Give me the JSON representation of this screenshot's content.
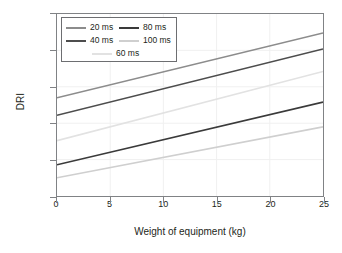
{
  "chart_data": {
    "type": "line",
    "title": "",
    "xlabel": "Weight of equipment (kg)",
    "ylabel": "DRI",
    "xlim": [
      0,
      25
    ],
    "ylim": [
      5,
      30
    ],
    "xticks": [
      0,
      5,
      10,
      15,
      20,
      25
    ],
    "yticks": [
      5,
      10,
      15,
      20,
      25,
      30
    ],
    "grid": true,
    "legend_position": "top-left",
    "x": [
      0,
      25
    ],
    "series": [
      {
        "name": "20 ms",
        "values": [
          18.5,
          27.4
        ],
        "color": "#8c8c8c"
      },
      {
        "name": "40 ms",
        "values": [
          16.1,
          25.2
        ],
        "color": "#4d4d4d"
      },
      {
        "name": "60 ms",
        "values": [
          12.6,
          22.1
        ],
        "color": "#e2e2e2"
      },
      {
        "name": "80 ms",
        "values": [
          9.3,
          17.9
        ],
        "color": "#3a3a3a"
      },
      {
        "name": "100 ms",
        "values": [
          7.5,
          14.5
        ],
        "color": "#cfcfcf"
      }
    ]
  },
  "axes": {
    "x_tick_labels": [
      "0",
      "5",
      "10",
      "15",
      "20",
      "25"
    ],
    "y_tick_labels": [
      "5",
      "10",
      "15",
      "20",
      "25",
      "30"
    ],
    "x_title": "Weight of equipment (kg)",
    "y_title": "DRI"
  },
  "legend": {
    "rows": [
      [
        {
          "label": "20 ms",
          "color": "#8c8c8c"
        },
        {
          "label": "80 ms",
          "color": "#3a3a3a"
        }
      ],
      [
        {
          "label": "40 ms",
          "color": "#4d4d4d"
        },
        {
          "label": "100 ms",
          "color": "#cfcfcf"
        }
      ],
      [
        {
          "label": "60 ms",
          "color": "#e2e2e2"
        }
      ]
    ]
  },
  "colors": {
    "frame": "#808285",
    "grid": "#f0f0f0",
    "text": "#231f20",
    "background": "#ffffff"
  }
}
